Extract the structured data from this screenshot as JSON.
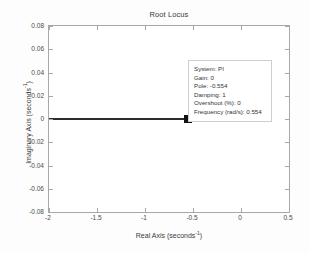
{
  "chart_data": {
    "type": "scatter",
    "title": "Root Locus",
    "xlabel": "Real Axis (seconds⁻¹)",
    "ylabel": "Imaginary Axis (seconds⁻¹)",
    "xlabel_base": "Real Axis (seconds",
    "xlabel_sup": "-1",
    "xlabel_tail": ")",
    "ylabel_base": "Imaginary Axis (seconds",
    "ylabel_sup": "-1",
    "ylabel_tail": ")",
    "xlim": [
      -2,
      0.5
    ],
    "ylim": [
      -0.08,
      0.08
    ],
    "xticks": [
      -2,
      -1.5,
      -1,
      -0.5,
      0,
      0.5
    ],
    "xtick_labels": [
      "-2",
      "-1.5",
      "-1",
      "-0.5",
      "0",
      "0.5"
    ],
    "yticks": [
      0.08,
      0.06,
      0.04,
      0.02,
      0,
      -0.02,
      -0.04,
      -0.06,
      -0.08
    ],
    "ytick_labels": [
      "0.08",
      "0.06",
      "0.04",
      "0.02",
      "0",
      "-0.02",
      "-0.04",
      "-0.06",
      "-0.08"
    ],
    "grid": false,
    "legend": null,
    "series": [
      {
        "name": "root-locus-branch",
        "type": "line",
        "color": "#2c2c2c",
        "points": [
          [
            -2,
            0
          ],
          [
            -0.554,
            0
          ]
        ]
      },
      {
        "name": "selected-pole",
        "type": "marker",
        "marker": "square",
        "color": "#111111",
        "points": [
          [
            -0.554,
            0
          ]
        ]
      }
    ],
    "annotations": [
      {
        "name": "data-cursor-tooltip",
        "x": -0.554,
        "y": 0,
        "lines": [
          "System: PI",
          "Gain: 0",
          "Pole: -0.554",
          "Damping: 1",
          "Overshoot (%): 0",
          "Frequency (rad/s): 0.554"
        ]
      }
    ]
  },
  "tooltip": {
    "system": "System: PI",
    "gain": "Gain: 0",
    "pole": "Pole: -0.554",
    "damping": "Damping: 1",
    "overshoot": "Overshoot (%): 0",
    "frequency": "Frequency (rad/s): 0.554"
  },
  "colors": {
    "locus": "#2c2c2c",
    "marker": "#111111",
    "axis": "#a8a8a8",
    "text": "#3a3a3a",
    "background": "#fdfdfd"
  }
}
